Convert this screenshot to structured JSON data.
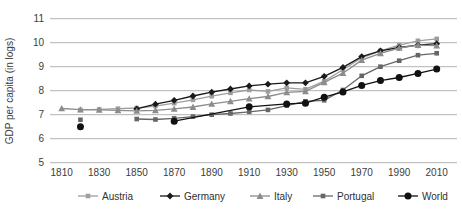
{
  "figure": {
    "ylabel": "GDP per capita (in logs)"
  },
  "chart_data": {
    "type": "line",
    "title": "",
    "xlabel": "",
    "ylabel": "GDP per capita (in logs)",
    "xlim": [
      1805,
      2015
    ],
    "ylim": [
      5,
      11
    ],
    "x_ticks": [
      1810,
      1830,
      1850,
      1870,
      1890,
      1910,
      1930,
      1950,
      1970,
      1990,
      2010
    ],
    "y_ticks": [
      5,
      6,
      7,
      8,
      9,
      10,
      11
    ],
    "grid": "horizontal-only",
    "gridline_color": "#b3b3b3",
    "legend_position": "bottom",
    "series": [
      {
        "name": "Austria",
        "marker": "square",
        "color": "#9e9e9e",
        "line_start_index": 0,
        "points": [
          [
            1820,
            7.2
          ],
          [
            1830,
            7.22
          ],
          [
            1840,
            7.25
          ],
          [
            1850,
            7.28
          ],
          [
            1860,
            7.36
          ],
          [
            1870,
            7.48
          ],
          [
            1880,
            7.62
          ],
          [
            1890,
            7.77
          ],
          [
            1900,
            7.91
          ],
          [
            1910,
            8.03
          ],
          [
            1920,
            7.97
          ],
          [
            1930,
            8.12
          ],
          [
            1940,
            8.06
          ],
          [
            1950,
            8.4
          ],
          [
            1960,
            8.87
          ],
          [
            1970,
            9.37
          ],
          [
            1980,
            9.66
          ],
          [
            1990,
            9.9
          ],
          [
            2000,
            10.08
          ],
          [
            2010,
            10.16
          ]
        ]
      },
      {
        "name": "Germany",
        "marker": "diamond",
        "color": "#1a1a1a",
        "line_start_index": 0,
        "points": [
          [
            1850,
            7.24
          ],
          [
            1860,
            7.44
          ],
          [
            1870,
            7.6
          ],
          [
            1880,
            7.78
          ],
          [
            1890,
            7.94
          ],
          [
            1900,
            8.07
          ],
          [
            1910,
            8.2
          ],
          [
            1920,
            8.27
          ],
          [
            1930,
            8.33
          ],
          [
            1940,
            8.33
          ],
          [
            1950,
            8.6
          ],
          [
            1960,
            8.97
          ],
          [
            1970,
            9.42
          ],
          [
            1980,
            9.66
          ],
          [
            1990,
            9.8
          ],
          [
            2000,
            9.9
          ],
          [
            2010,
            9.96
          ]
        ]
      },
      {
        "name": "Italy",
        "marker": "triangle",
        "color": "#8c8c8c",
        "line_start_index": 0,
        "points": [
          [
            1810,
            7.26
          ],
          [
            1820,
            7.21
          ],
          [
            1830,
            7.2
          ],
          [
            1840,
            7.18
          ],
          [
            1850,
            7.16
          ],
          [
            1860,
            7.18
          ],
          [
            1870,
            7.24
          ],
          [
            1880,
            7.32
          ],
          [
            1890,
            7.45
          ],
          [
            1900,
            7.56
          ],
          [
            1910,
            7.67
          ],
          [
            1920,
            7.76
          ],
          [
            1930,
            7.93
          ],
          [
            1940,
            7.97
          ],
          [
            1950,
            8.35
          ],
          [
            1960,
            8.73
          ],
          [
            1970,
            9.27
          ],
          [
            1980,
            9.56
          ],
          [
            1990,
            9.78
          ],
          [
            2000,
            9.9
          ],
          [
            2010,
            9.88
          ]
        ]
      },
      {
        "name": "Portugal",
        "marker": "square",
        "color": "#666666",
        "line_start_index": 1,
        "points": [
          [
            1820,
            6.79
          ],
          [
            1850,
            6.82
          ],
          [
            1860,
            6.8
          ],
          [
            1870,
            6.85
          ],
          [
            1880,
            6.92
          ],
          [
            1890,
            7.0
          ],
          [
            1900,
            7.05
          ],
          [
            1910,
            7.12
          ],
          [
            1920,
            7.2
          ],
          [
            1930,
            7.38
          ],
          [
            1940,
            7.56
          ],
          [
            1950,
            7.6
          ],
          [
            1960,
            8.03
          ],
          [
            1970,
            8.62
          ],
          [
            1980,
            9.0
          ],
          [
            1990,
            9.25
          ],
          [
            2000,
            9.48
          ],
          [
            2010,
            9.56
          ]
        ]
      },
      {
        "name": "World",
        "marker": "circle",
        "color": "#111111",
        "line_start_index": 1,
        "points": [
          [
            1820,
            6.5
          ],
          [
            1870,
            6.73
          ],
          [
            1910,
            7.33
          ],
          [
            1930,
            7.45
          ],
          [
            1940,
            7.48
          ],
          [
            1950,
            7.73
          ],
          [
            1960,
            7.95
          ],
          [
            1970,
            8.22
          ],
          [
            1980,
            8.42
          ],
          [
            1990,
            8.55
          ],
          [
            2000,
            8.72
          ],
          [
            2010,
            8.9
          ]
        ]
      }
    ]
  }
}
